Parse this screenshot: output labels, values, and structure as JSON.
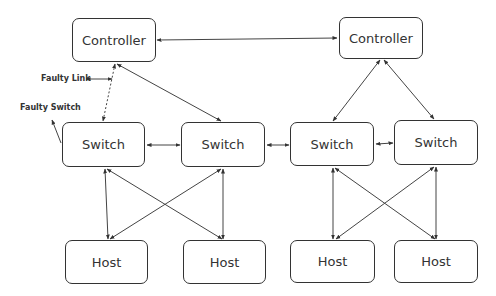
{
  "diagram": {
    "title": "",
    "controllers": [
      {
        "id": "c1",
        "label": "Controller",
        "x": 72,
        "y": 18,
        "w": 84,
        "h": 44
      },
      {
        "id": "c2",
        "label": "Controller",
        "x": 339,
        "y": 17,
        "w": 84,
        "h": 42
      }
    ],
    "switches": [
      {
        "id": "s1",
        "label": "Switch",
        "x": 62,
        "y": 122,
        "w": 83,
        "h": 45
      },
      {
        "id": "s2",
        "label": "Switch",
        "x": 181,
        "y": 122,
        "w": 84,
        "h": 45
      },
      {
        "id": "s3",
        "label": "Switch",
        "x": 290,
        "y": 122,
        "w": 84,
        "h": 44
      },
      {
        "id": "s4",
        "label": "Switch",
        "x": 394,
        "y": 120,
        "w": 84,
        "h": 45
      }
    ],
    "hosts": [
      {
        "id": "h1",
        "label": "Host",
        "x": 65,
        "y": 240,
        "w": 83,
        "h": 44
      },
      {
        "id": "h2",
        "label": "Host",
        "x": 183,
        "y": 240,
        "w": 83,
        "h": 44
      },
      {
        "id": "h3",
        "label": "Host",
        "x": 290,
        "y": 240,
        "w": 85,
        "h": 43
      },
      {
        "id": "h4",
        "label": "Host",
        "x": 394,
        "y": 240,
        "w": 84,
        "h": 43
      }
    ],
    "annotations": {
      "faulty_link": "Faulty Link",
      "faulty_switch": "Faulty Switch"
    },
    "links": [
      {
        "from": "c1",
        "to": "c2",
        "style": "solid",
        "bidirectional": true
      },
      {
        "from": "c1",
        "to": "s1",
        "style": "dotted",
        "bidirectional": true,
        "note": "Faulty Link"
      },
      {
        "from": "c1",
        "to": "s2",
        "style": "solid",
        "bidirectional": true
      },
      {
        "from": "c2",
        "to": "s3",
        "style": "solid",
        "bidirectional": true
      },
      {
        "from": "c2",
        "to": "s4",
        "style": "solid",
        "bidirectional": true
      },
      {
        "from": "s1",
        "to": "s2",
        "style": "solid",
        "bidirectional": true
      },
      {
        "from": "s2",
        "to": "s3",
        "style": "solid",
        "bidirectional": true
      },
      {
        "from": "s3",
        "to": "s4",
        "style": "solid",
        "bidirectional": true
      },
      {
        "from": "s1",
        "to": "h1",
        "style": "solid",
        "bidirectional": true
      },
      {
        "from": "s1",
        "to": "h2",
        "style": "solid",
        "bidirectional": true
      },
      {
        "from": "s2",
        "to": "h1",
        "style": "solid",
        "bidirectional": true
      },
      {
        "from": "s2",
        "to": "h2",
        "style": "solid",
        "bidirectional": true
      },
      {
        "from": "s3",
        "to": "h3",
        "style": "solid",
        "bidirectional": true
      },
      {
        "from": "s3",
        "to": "h4",
        "style": "solid",
        "bidirectional": true
      },
      {
        "from": "s4",
        "to": "h3",
        "style": "solid",
        "bidirectional": true
      },
      {
        "from": "s4",
        "to": "h4",
        "style": "solid",
        "bidirectional": true
      }
    ],
    "colors": {
      "stroke": "#333333",
      "background": "#ffffff",
      "text": "#333333"
    }
  }
}
